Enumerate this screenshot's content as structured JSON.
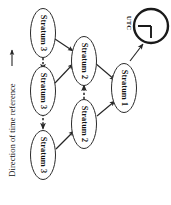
{
  "figure": {
    "orientation": "rotated-90-ccw",
    "background_color": "#ffffff",
    "ink_color": "#222222"
  },
  "axis": {
    "label": "Direction of time reference",
    "arrow_direction": "up",
    "icon": "left-arrow-icon"
  },
  "reference_clock": {
    "label": "UTC",
    "icon": "clock-icon"
  },
  "nodes": [
    {
      "id": "stratum3-a",
      "label": "Stratum 3"
    },
    {
      "id": "stratum3-b",
      "label": "Stratum 3"
    },
    {
      "id": "stratum3-c",
      "label": "Stratum 3"
    },
    {
      "id": "stratum2-a",
      "label": "Stratum 2"
    },
    {
      "id": "stratum2-b",
      "label": "Stratum 2"
    },
    {
      "id": "stratum1",
      "label": "Stratum 1"
    }
  ],
  "edges": [
    {
      "from": "stratum3-a",
      "to": "stratum2-a",
      "style": "solid"
    },
    {
      "from": "stratum3-b",
      "to": "stratum2-a",
      "style": "solid"
    },
    {
      "from": "stratum3-c",
      "to": "stratum2-b",
      "style": "solid"
    },
    {
      "from": "stratum2-a",
      "to": "stratum1",
      "style": "solid"
    },
    {
      "from": "stratum2-b",
      "to": "stratum1",
      "style": "solid"
    },
    {
      "from": "stratum1",
      "to": "reference_clock",
      "style": "solid"
    },
    {
      "from": "stratum3-a",
      "to": "stratum3-b",
      "style": "dashed"
    },
    {
      "from": "stratum3-b",
      "to": "stratum3-c",
      "style": "dashed"
    },
    {
      "from": "stratum2-b",
      "to": "stratum2-a",
      "style": "dashed"
    }
  ]
}
